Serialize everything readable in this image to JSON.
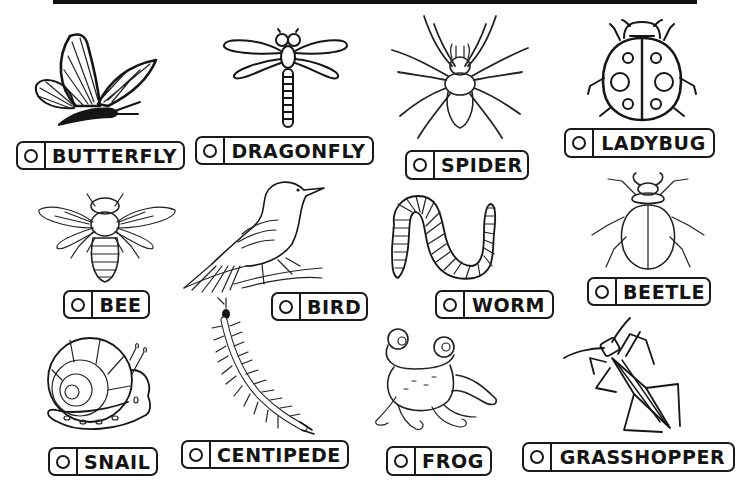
{
  "worksheet": {
    "title_box": "",
    "items": [
      {
        "id": "butterfly",
        "label": "BUTTERFLY",
        "icon": "butterfly-drawing",
        "checked": false
      },
      {
        "id": "dragonfly",
        "label": "DRAGONFLY",
        "icon": "dragonfly-drawing",
        "checked": false
      },
      {
        "id": "spider",
        "label": "SPIDER",
        "icon": "spider-drawing",
        "checked": false
      },
      {
        "id": "ladybug",
        "label": "LADYBUG",
        "icon": "ladybug-drawing",
        "checked": false
      },
      {
        "id": "bee",
        "label": "BEE",
        "icon": "bee-drawing",
        "checked": false
      },
      {
        "id": "bird",
        "label": "BIRD",
        "icon": "bird-drawing",
        "checked": false
      },
      {
        "id": "worm",
        "label": "WORM",
        "icon": "worm-drawing",
        "checked": false
      },
      {
        "id": "beetle",
        "label": "BEETLE",
        "icon": "beetle-drawing",
        "checked": false
      },
      {
        "id": "snail",
        "label": "SNAIL",
        "icon": "snail-drawing",
        "checked": false
      },
      {
        "id": "centipede",
        "label": "CENTIPEDE",
        "icon": "centipede-drawing",
        "checked": false
      },
      {
        "id": "frog",
        "label": "FROG",
        "icon": "frog-drawing",
        "checked": false
      },
      {
        "id": "grasshopper",
        "label": "GRASSHOPPER",
        "icon": "grasshopper-drawing",
        "checked": false
      }
    ]
  },
  "colors": {
    "ink": "#151515",
    "background": "#ffffff"
  }
}
